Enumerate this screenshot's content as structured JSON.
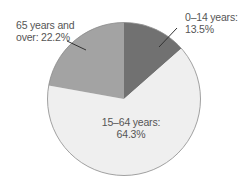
{
  "chart_data": {
    "type": "pie",
    "title": "",
    "start_angle": "12 o'clock",
    "direction": "clockwise",
    "categories": [
      "0–14 years",
      "15–64 years",
      "65 years and over"
    ],
    "values": [
      13.5,
      64.3,
      22.2
    ],
    "unit": "%",
    "colors": [
      "#717171",
      "#efefef",
      "#a3a3a3"
    ],
    "legend": "none (direct labels)",
    "labels": [
      {
        "line1": "0–14 years:",
        "line2": "13.5%",
        "leader_line": true
      },
      {
        "line1": "15–64 years:",
        "line2": "64.3%",
        "leader_line": false
      },
      {
        "line1": "65 years and",
        "line2": "over: 22.2%",
        "leader_line": true
      }
    ]
  },
  "style": {
    "outline": "#8a8a8a",
    "leader": "#333333",
    "text": "#555555"
  }
}
